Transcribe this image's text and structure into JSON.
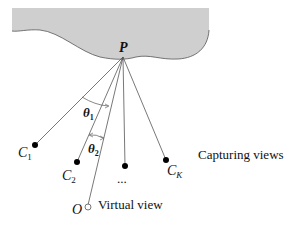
{
  "diagram": {
    "surface_label": "P",
    "captures": [
      {
        "label": "C",
        "sub": "1"
      },
      {
        "label": "C",
        "sub": "2"
      },
      {
        "label": "...",
        "sub": ""
      },
      {
        "label": "C",
        "sub": "K"
      }
    ],
    "virtual": {
      "label": "O"
    },
    "angles": [
      {
        "label": "θ",
        "sub": "1"
      },
      {
        "label": "θ",
        "sub": "2"
      }
    ],
    "captions": {
      "capturing": "Capturing views",
      "virtual": "Virtual view"
    },
    "colors": {
      "surface": "#cfcfcf",
      "outline": "#555555",
      "line": "#444444",
      "dot": "#000000"
    }
  }
}
